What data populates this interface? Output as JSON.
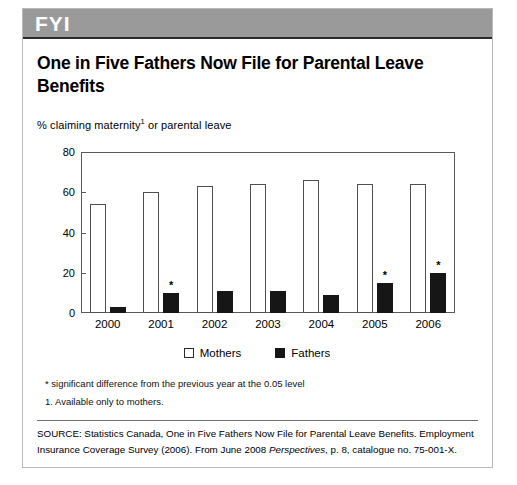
{
  "box": {
    "band_label": "FYI",
    "headline": "One in Five Fathers Now File for Parental Leave Benefits"
  },
  "chart_data": {
    "type": "bar",
    "title": "One in Five Fathers Now File for Parental Leave Benefits",
    "subtitle_prefix": "% claiming maternity",
    "subtitle_footnote_marker": "1",
    "subtitle_suffix": " or parental leave",
    "xlabel": "",
    "ylabel": "",
    "ylim": [
      0,
      80
    ],
    "yticks": [
      0,
      20,
      40,
      60,
      80
    ],
    "ytick_labels": [
      "0",
      "20",
      "40",
      "60",
      "80"
    ],
    "grid": false,
    "legend_position": "bottom-center",
    "categories": [
      "2000",
      "2001",
      "2002",
      "2003",
      "2004",
      "2005",
      "2006"
    ],
    "series": [
      {
        "name": "Mothers",
        "color": "#ffffff",
        "edge_color": "#4f4f4f",
        "values": [
          54,
          60,
          63,
          64,
          66,
          64,
          64
        ]
      },
      {
        "name": "Fathers",
        "color": "#161616",
        "edge_color": "#161616",
        "values": [
          3,
          10,
          11,
          11,
          9,
          15,
          20
        ]
      }
    ],
    "annotations": [
      {
        "series": "Fathers",
        "category": "2001",
        "marker": "*"
      },
      {
        "series": "Fathers",
        "category": "2005",
        "marker": "*"
      },
      {
        "series": "Fathers",
        "category": "2006",
        "marker": "*"
      }
    ]
  },
  "legend": {
    "items": [
      {
        "label": "Mothers",
        "style": "open"
      },
      {
        "label": "Fathers",
        "style": "solid"
      }
    ]
  },
  "footnotes": {
    "significance": "* significant difference from the previous year at the 0.05 level",
    "note_one": "1. Available only to mothers."
  },
  "source": {
    "part_one": "SOURCE: Statistics Canada, One in Five Fathers Now File for Parental Leave Benefits. Employment Insurance Coverage Survey (2006). From June 2008 ",
    "italic": "Perspectives",
    "part_two": ", p. 8, catalogue no. 75-001-X."
  }
}
